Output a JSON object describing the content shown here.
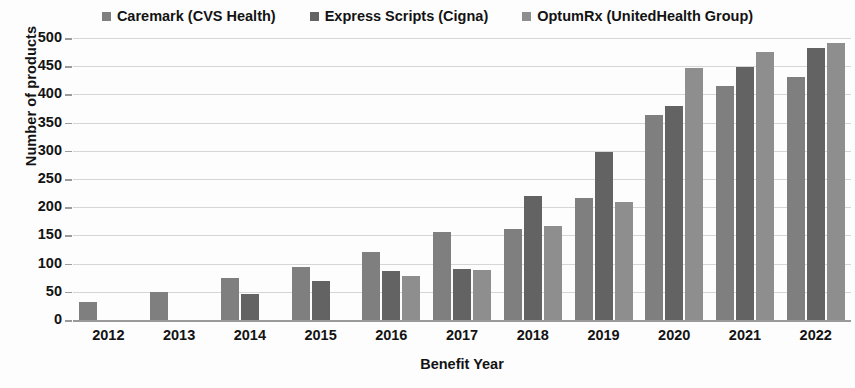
{
  "chart_data": {
    "type": "bar",
    "title": "",
    "xlabel": "Benefit Year",
    "ylabel": "Number of products",
    "ylim": [
      0,
      500
    ],
    "yticks": [
      0,
      50,
      100,
      150,
      200,
      250,
      300,
      350,
      400,
      450,
      500
    ],
    "grid": true,
    "legend_position": "top-center",
    "categories": [
      "2012",
      "2013",
      "2014",
      "2015",
      "2016",
      "2017",
      "2018",
      "2019",
      "2020",
      "2021",
      "2022"
    ],
    "series": [
      {
        "name": "Caremark (CVS Health)",
        "color": "#7f7f7f",
        "values": [
          32,
          50,
          75,
          94,
          121,
          156,
          162,
          216,
          363,
          415,
          430
        ]
      },
      {
        "name": "Express Scripts (Cigna)",
        "color": "#636363",
        "values": [
          null,
          null,
          47,
          70,
          87,
          90,
          220,
          298,
          379,
          448,
          483
        ]
      },
      {
        "name": "OptumRx (UnitedHealth Group)",
        "color": "#8e8e8e",
        "values": [
          null,
          null,
          null,
          null,
          78,
          88,
          166,
          210,
          447,
          475,
          492
        ]
      }
    ]
  }
}
